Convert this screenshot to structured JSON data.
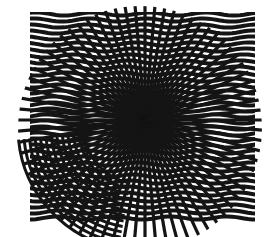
{
  "artwork": {
    "style": "op-art moire pattern",
    "background": "#ffffff",
    "ink": "#141414",
    "layers": [
      {
        "name": "wavy-horizontal-stripes",
        "x": 30,
        "y": 12,
        "width": 225,
        "height": 210
      },
      {
        "name": "concentric-arcs",
        "cx": 140,
        "cy": 128,
        "rings": 12
      },
      {
        "name": "radial-spokes",
        "cx": 145,
        "cy": 120,
        "count": 72
      }
    ]
  }
}
